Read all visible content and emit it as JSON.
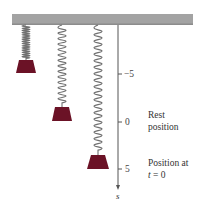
{
  "diagram": {
    "colors": {
      "ceiling": "#a3a3a3",
      "ceiling_shadow": "#8c8c8c",
      "weight": "#6b1226",
      "spring": "#707070",
      "axis": "#555555"
    },
    "ceiling": {
      "x": 12,
      "y": 14,
      "width": 181,
      "height": 11
    },
    "springs": [
      {
        "name": "compressed",
        "cx": 26,
        "top": 25,
        "bottom": 60,
        "coils": 15,
        "half_width": 5
      },
      {
        "name": "rest",
        "cx": 62,
        "top": 25,
        "bottom": 107,
        "coils": 14,
        "half_width": 5
      },
      {
        "name": "stretched",
        "cx": 98,
        "top": 25,
        "bottom": 155,
        "coils": 19,
        "half_width": 5
      }
    ],
    "weights": [
      {
        "name": "weight-compressed",
        "cx": 26,
        "top": 60,
        "bottom": 73,
        "top_half": 7,
        "bottom_half": 10
      },
      {
        "name": "weight-rest",
        "cx": 62,
        "top": 107,
        "bottom": 121,
        "top_half": 7,
        "bottom_half": 10
      },
      {
        "name": "weight-initial",
        "cx": 98,
        "top": 155,
        "bottom": 169,
        "top_half": 7,
        "bottom_half": 11
      }
    ],
    "axis": {
      "x": 118,
      "top": 25,
      "bottom": 190,
      "variable": "s",
      "ticks": [
        {
          "value": "−5",
          "y": 74
        },
        {
          "value": "0",
          "y": 122
        },
        {
          "value": "5",
          "y": 169
        }
      ]
    },
    "annotations": {
      "rest_line1": "Rest",
      "rest_line2": "position",
      "initial_line1": "Position at",
      "initial_line2_var": "t",
      "initial_line2_rest": " = 0"
    }
  }
}
